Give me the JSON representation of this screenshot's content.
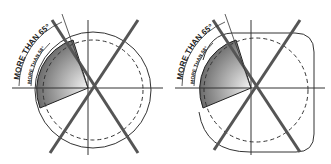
{
  "diagrams": [
    {
      "id": "round",
      "outline": "circle",
      "outer_label": "MORE THAN 65°",
      "inner_label": "MORE THAN 58°"
    },
    {
      "id": "rounded-square",
      "outline": "rounded-square",
      "outer_label": "MORE THAN 65°",
      "inner_label": "MORE THAN 58°"
    }
  ],
  "colors": {
    "line": "#2a2a2a",
    "thick_line": "#555555",
    "shade_dark": "#5a5a5a",
    "shade_light": "#f0f0f0"
  }
}
